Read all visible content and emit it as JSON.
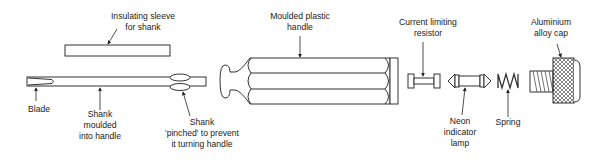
{
  "diagram": {
    "colors": {
      "line": "#333333",
      "background": "#ffffff",
      "text": "#222222"
    },
    "labels": {
      "insulating_sleeve": [
        "Insulating sleeve",
        "for shank"
      ],
      "moulded_handle": [
        "Moulded plastic",
        "handle"
      ],
      "resistor": [
        "Current limiting",
        "resistor"
      ],
      "cap": [
        "Aluminium",
        "alloy cap"
      ],
      "blade": [
        "Blade"
      ],
      "shank_moulded": [
        "Shank",
        "moulded",
        "into handle"
      ],
      "shank_pinched": [
        "Shank",
        "'pinched' to prevent",
        "it turning handle"
      ],
      "neon_lamp": [
        "Neon",
        "indicator",
        "lamp"
      ],
      "spring": [
        "Spring"
      ]
    },
    "components": [
      "blade",
      "shank",
      "insulating-sleeve",
      "moulded-plastic-handle",
      "current-limiting-resistor",
      "neon-indicator-lamp",
      "spring",
      "aluminium-alloy-cap"
    ]
  }
}
